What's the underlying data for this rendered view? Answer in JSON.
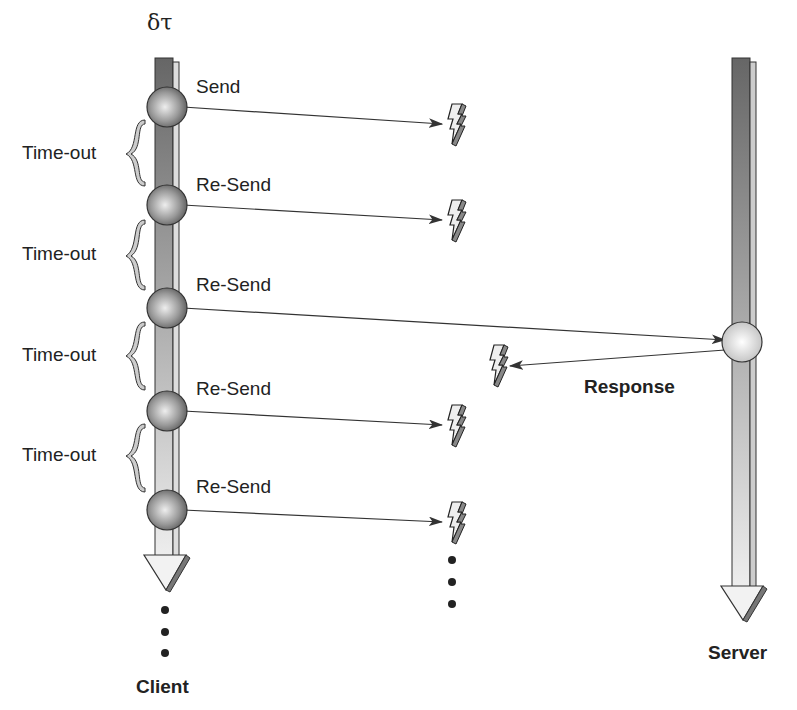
{
  "diagram": {
    "type": "sequence-timeline",
    "client": {
      "label": "Client",
      "top_label": "δτ"
    },
    "server": {
      "label": "Server"
    },
    "messages": [
      {
        "label": "Send",
        "y": 107,
        "lost": true
      },
      {
        "label": "Re-Send",
        "y": 205,
        "lost": true
      },
      {
        "label": "Re-Send",
        "y": 308,
        "lost": false
      },
      {
        "label": "Re-Send",
        "y": 411,
        "lost": true
      },
      {
        "label": "Re-Send",
        "y": 510,
        "lost": true
      }
    ],
    "timeouts": [
      {
        "label": "Time-out"
      },
      {
        "label": "Time-out"
      },
      {
        "label": "Time-out"
      },
      {
        "label": "Time-out"
      }
    ],
    "response": {
      "label": "Response",
      "lost": true
    },
    "continuation": "..."
  }
}
